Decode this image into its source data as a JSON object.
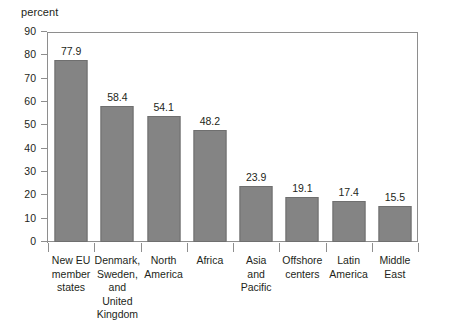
{
  "chart_data": {
    "type": "bar",
    "title": "",
    "subtitle": "",
    "xlabel": "",
    "ylabel": "percent",
    "ylim": [
      0,
      90
    ],
    "y_ticks": [
      0,
      10,
      20,
      30,
      40,
      50,
      60,
      70,
      80,
      90
    ],
    "grid": false,
    "legend": false,
    "legend_position": "none",
    "bar_color": "#848484",
    "bar_border_color": "#6f6f6f",
    "axis_color": "#8e8e8e",
    "text_color": "#231f20",
    "background": "#ffffff",
    "categories": [
      "New EU member states",
      "Denmark, Sweden, and United Kingdom",
      "North America",
      "Africa",
      "Asia and Pacific",
      "Offshore centers",
      "Latin America",
      "Middle East"
    ],
    "category_lines": [
      [
        "New EU",
        "member",
        "states"
      ],
      [
        "Denmark,",
        "Sweden,",
        "and",
        "United",
        "Kingdom"
      ],
      [
        "North",
        "America"
      ],
      [
        "Africa"
      ],
      [
        "Asia",
        "and",
        "Pacific"
      ],
      [
        "Offshore",
        "centers"
      ],
      [
        "Latin",
        "America"
      ],
      [
        "Middle",
        "East"
      ]
    ],
    "values": [
      77.9,
      58.4,
      54.1,
      48.2,
      23.9,
      19.1,
      17.4,
      15.5
    ],
    "value_labels": [
      "77.9",
      "58.4",
      "54.1",
      "48.2",
      "23.9",
      "19.1",
      "17.4",
      "15.5"
    ]
  },
  "axis": {
    "unit_label": "percent",
    "y_tick_labels": [
      "90",
      "80",
      "70",
      "60",
      "50",
      "40",
      "30",
      "20",
      "10",
      "0"
    ]
  }
}
